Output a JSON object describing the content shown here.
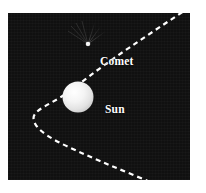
{
  "figure": {
    "background_color": "#ffffff",
    "panel_color": "#101010",
    "accent_color": "#ffffff",
    "panel": {
      "x": 8,
      "y": 13,
      "width": 182,
      "height": 167
    }
  },
  "labels": {
    "comet": "Comet",
    "sun": "Sun"
  },
  "objects": {
    "sun": {
      "name": "Sun",
      "center_x": 78,
      "center_y": 97,
      "radius": 15,
      "fill_color": "#f2f2f2"
    },
    "comet": {
      "name": "Comet",
      "nucleus_x": 88,
      "nucleus_y": 44,
      "nucleus_radius": 2.2,
      "fill_color": "#ffffff",
      "tail_direction": "upper-right"
    }
  },
  "orbit": {
    "name": "comet-orbit-path",
    "shape": "parabola",
    "style": "dashed",
    "color": "#ffffff",
    "dash": "5 4",
    "vertex_x": 34,
    "vertex_y": 98
  }
}
